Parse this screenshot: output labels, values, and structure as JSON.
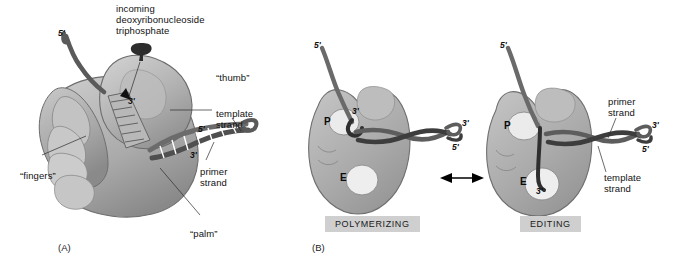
{
  "figure": {
    "panels": [
      {
        "tag": "(A)",
        "description": "Hand-shaped DNA polymerase with fingers, palm and thumb domains"
      },
      {
        "tag": "(B)",
        "description": "Polymerizing and editing modes of DNA polymerase"
      }
    ]
  },
  "panel_a": {
    "tag": "(A)",
    "labels": {
      "incoming_nucleotide": "incoming\ndeoxyribonucleoside\ntriphosphate",
      "thumb": "“thumb”",
      "fingers": "“fingers”",
      "palm": "“palm”",
      "template_strand": "template\nstrand",
      "primer_strand": "primer\nstrand"
    },
    "end_labels": {
      "template_5_prime_top": "5'",
      "active_site_3_prime": "3'",
      "duplex_5_prime": "5'",
      "primer_3_prime": "3'"
    }
  },
  "panel_b": {
    "tag": "(B)",
    "states": [
      {
        "name": "polymerizing",
        "state_label": "POLYMERIZING",
        "site_labels": {
          "polymerizing_site": "P",
          "editing_site": "E"
        },
        "end_labels": {
          "template_5_prime": "5'",
          "primer_3_prime_in_p_site": "3'",
          "duplex_3_prime": "3'",
          "duplex_5_prime": "5'"
        }
      },
      {
        "name": "editing",
        "state_label": "EDITING",
        "site_labels": {
          "polymerizing_site": "P",
          "editing_site": "E"
        },
        "end_labels": {
          "template_5_prime": "5'",
          "primer_3_prime_in_e_site": "3'",
          "duplex_3_prime": "3'",
          "duplex_5_prime": "5'"
        },
        "labels": {
          "primer_strand": "primer\nstrand",
          "template_strand": "template\nstrand"
        }
      }
    ],
    "transition_arrow": "↔"
  },
  "colors": {
    "background": "#ffffff",
    "protein_fill": "#b0b0b0",
    "protein_fill_light": "#c6c6c6",
    "protein_outline": "#6f6f6f",
    "site_cavity": "#e8e8e8",
    "dna_dark": "#4a4a4a",
    "dna_darker": "#333333",
    "state_box_bg": "#cfcfcf",
    "text": "#111111"
  }
}
